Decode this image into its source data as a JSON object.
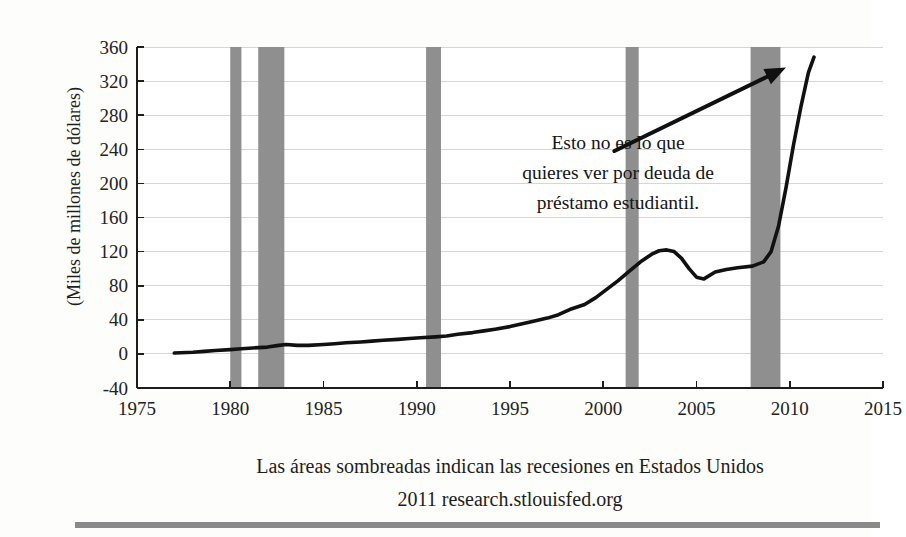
{
  "chart_data": {
    "type": "line",
    "title": "",
    "xlabel": "",
    "ylabel": "(Miles de millones de dólares)",
    "xlim": [
      1975,
      2015
    ],
    "ylim": [
      -40,
      360
    ],
    "grid": true,
    "legend": "none",
    "x_ticks": [
      "1975",
      "1980",
      "1985",
      "1990",
      "1995",
      "2000",
      "2005",
      "2010",
      "2015"
    ],
    "x_tick_values": [
      1975,
      1980,
      1985,
      1990,
      1995,
      2000,
      2005,
      2010,
      2015
    ],
    "y_ticks": [
      "-40",
      "0",
      "40",
      "80",
      "120",
      "160",
      "200",
      "240",
      "280",
      "320",
      "360"
    ],
    "y_tick_values": [
      -40,
      0,
      40,
      80,
      120,
      160,
      200,
      240,
      280,
      320,
      360
    ],
    "series": [
      {
        "name": "Deuda de préstamo estudiantil",
        "color": "#111111",
        "x": [
          1977.0,
          1978.0,
          1978.6,
          1979.2,
          1980.0,
          1980.6,
          1981.2,
          1982.0,
          1982.6,
          1983.0,
          1983.6,
          1984.2,
          1985.0,
          1985.6,
          1986.2,
          1987.0,
          1987.6,
          1988.2,
          1989.0,
          1989.6,
          1990.2,
          1991.0,
          1991.6,
          1992.2,
          1993.0,
          1993.6,
          1994.2,
          1995.0,
          1995.6,
          1996.2,
          1997.0,
          1997.6,
          1998.2,
          1999.0,
          1999.6,
          2000.2,
          2000.8,
          2001.4,
          2002.0,
          2002.6,
          2003.0,
          2003.4,
          2003.8,
          2004.2,
          2004.6,
          2005.0,
          2005.4,
          2006.0,
          2006.6,
          2007.2,
          2008.0,
          2008.6,
          2009.0,
          2009.4,
          2009.8,
          2010.2,
          2010.6,
          2011.0,
          2011.3
        ],
        "y": [
          1,
          2,
          3,
          4,
          5,
          6,
          7,
          8,
          10,
          11,
          10,
          10,
          11,
          12,
          13,
          14,
          15,
          16,
          17,
          18,
          19,
          20,
          21,
          23,
          25,
          27,
          29,
          32,
          35,
          38,
          42,
          46,
          52,
          58,
          66,
          76,
          86,
          97,
          108,
          117,
          121,
          122,
          120,
          112,
          100,
          90,
          88,
          96,
          99,
          101,
          103,
          108,
          120,
          150,
          195,
          245,
          290,
          330,
          348
        ]
      }
    ],
    "recession_bands": [
      {
        "start": 1980.0,
        "end": 1980.6,
        "label": "recesión 1980"
      },
      {
        "start": 1981.5,
        "end": 1982.9,
        "label": "recesión 1981-1982"
      },
      {
        "start": 1990.5,
        "end": 1991.3,
        "label": "recesión 1990-1991"
      },
      {
        "start": 2001.2,
        "end": 2001.9,
        "label": "recesión 2001"
      },
      {
        "start": 2007.9,
        "end": 2009.5,
        "label": "recesión 2007-2009"
      }
    ],
    "recession_band_color": "#8f8f8f",
    "annotations": [
      {
        "name": "student-loan-callout",
        "lines": [
          "Esto no es lo que",
          "quieres ver por deuda de",
          "préstamo estudiantil."
        ],
        "arrow_from": [
          2000.6,
          238
        ],
        "arrow_to": [
          2009.8,
          336
        ]
      }
    ],
    "captions": [
      "Las áreas sombreadas indican las recesiones en Estados Unidos",
      "2011 research.stlouisfed.org"
    ]
  },
  "footer_rule": {
    "color": "#8a8a8a",
    "name": "horizontal-rule"
  }
}
